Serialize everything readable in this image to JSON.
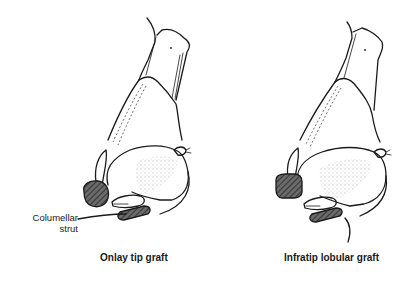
{
  "figure": {
    "panels": [
      {
        "id": "left",
        "caption": "Onlay tip graft",
        "callout": {
          "line1": "Columellar",
          "line2": "strut"
        }
      },
      {
        "id": "right",
        "caption": "Infratip lobular graft"
      }
    ],
    "colors": {
      "ink": "#1a1a1a",
      "graft_fill": "#555555",
      "background": "#ffffff"
    }
  }
}
